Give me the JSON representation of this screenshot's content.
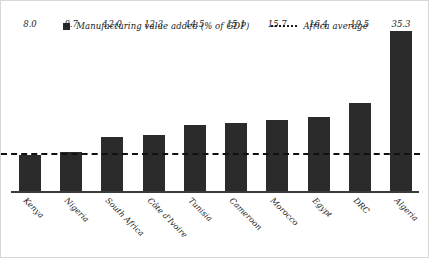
{
  "legend": {
    "bar_series_label": "Manufacturing value added (% of GDP)",
    "average_label": "Africa average",
    "bar_swatch_icon": "square-marker-icon",
    "average_line_icon": "dotted-line-icon"
  },
  "chart_data": {
    "type": "bar",
    "title": "",
    "subtitle": "",
    "xlabel": "",
    "ylabel": "",
    "ylim": [
      0,
      35.3
    ],
    "grid": false,
    "legend_position": "top-center",
    "orientation": "vertical",
    "bar_color": "#2b2b2b",
    "average_line_color": "#111111",
    "average_line_style": "dashed",
    "categories": [
      "Kenya",
      "Nigeria",
      "South Africa",
      "Côte d'Ivoire",
      "Tunisia",
      "Cameroon",
      "Morocco",
      "Egypt",
      "DRC",
      "Algeria"
    ],
    "values": [
      8.0,
      8.7,
      12.0,
      12.3,
      14.5,
      15.1,
      15.7,
      16.4,
      19.5,
      35.3
    ],
    "value_labels": [
      "8.0",
      "8.7",
      "12.0",
      "12.3",
      "14.5",
      "15.1",
      "15.7",
      "16.4",
      "19.5",
      "35.3"
    ],
    "series": [
      {
        "name": "Manufacturing value added (% of GDP)",
        "values": [
          8.0,
          8.7,
          12.0,
          12.3,
          14.5,
          15.1,
          15.7,
          16.4,
          19.5,
          35.3
        ]
      }
    ],
    "annotations": [
      {
        "name": "Africa average",
        "type": "horizontal-line",
        "value": 8.4
      }
    ]
  }
}
